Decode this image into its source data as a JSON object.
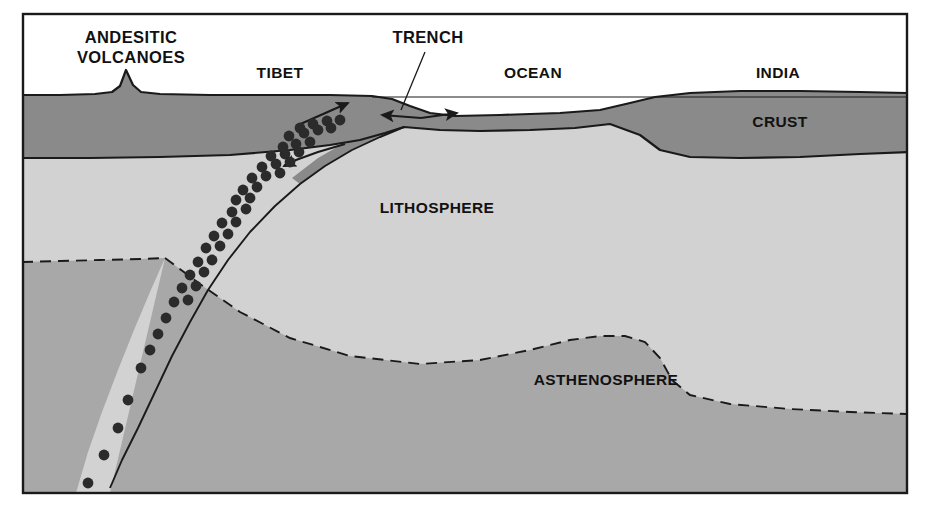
{
  "figure": {
    "type": "geological-cross-section",
    "frame": {
      "border_color": "#1a1a1a",
      "border_width": 2,
      "x": 22,
      "y": 13,
      "width": 886,
      "height": 481,
      "background": "#ffffff"
    },
    "palette": {
      "sky": "#ffffff",
      "crust": "#8a8a8a",
      "lithosphere": "#d2d2d2",
      "asthenosphere": "#a8a8a8",
      "outline": "#1a1a1a",
      "earthquake_dot": "#2b2b2b",
      "text": "#111111"
    }
  },
  "labels": [
    {
      "id": "andesitic-volcanoes",
      "line1": "ANDESITIC",
      "line2": "VOLCANOES",
      "x": 131,
      "y1": 43,
      "y2": 63,
      "anchor": "middle",
      "size": "label-lg"
    },
    {
      "id": "tibet",
      "text": "TIBET",
      "x": 280,
      "y": 78,
      "anchor": "middle",
      "size": "label-md"
    },
    {
      "id": "trench",
      "text": "TRENCH",
      "x": 428,
      "y": 43,
      "anchor": "middle",
      "size": "label-lg"
    },
    {
      "id": "ocean",
      "text": "OCEAN",
      "x": 533,
      "y": 78,
      "anchor": "middle",
      "size": "label-md"
    },
    {
      "id": "india",
      "text": "INDIA",
      "x": 778,
      "y": 78,
      "anchor": "middle",
      "size": "label-md"
    },
    {
      "id": "crust",
      "text": "CRUST",
      "x": 780,
      "y": 127,
      "anchor": "middle",
      "size": "label-md"
    },
    {
      "id": "lithosphere",
      "text": "LITHOSPHERE",
      "x": 437,
      "y": 213,
      "anchor": "middle",
      "size": "label-md"
    },
    {
      "id": "asthenosphere",
      "text": "ASTHENOSPHERE",
      "x": 606,
      "y": 385,
      "anchor": "middle",
      "size": "label-md"
    }
  ],
  "geometry": {
    "crust_top_surface": "M 22 95 L 60 95 L 95 94 L 112 92 L 120 86 L 126 70 L 133 85 L 141 92 L 160 94 L 210 95 L 270 95 L 330 95 L 372 96 L 392 99 L 410 106 L 430 113 L 455 116 L 500 115 L 560 113 L 600 110 L 630 103 L 655 97 L 690 93 L 740 91 L 800 91 L 860 92 L 908 93",
    "crust_bottom_left": "M 22 158 L 90 158 L 160 157 L 230 155 L 290 150 L 330 145 L 360 140 L 385 133 L 404 127",
    "sea_level_line": {
      "x1": 372,
      "y1": 97,
      "x2": 908,
      "y2": 97
    },
    "ocean_crust_bottom": "M 404 127 L 440 130 L 480 131 L 530 130 L 575 128 L 610 124 L 640 135 L 660 150 L 690 157 L 740 158 L 800 157 L 860 154 L 908 152",
    "slab_line": "M 404 127 L 380 137 L 352 150 L 325 166 L 300 184 L 275 206 L 250 232 L 228 260 L 208 290 L 190 322 L 172 356 L 155 392 L 138 428 L 122 460 L 110 486",
    "asthenosphere_left_dash": "M 22 262 L 60 261 L 100 260 L 140 259 L 165 258",
    "asthenosphere_right_dash": "M 165 258 L 200 284 L 240 312 L 290 338 L 350 356 L 420 364 L 480 360 L 530 350 L 570 340 L 600 336 L 625 336 L 645 342 L 660 358 L 672 380 L 690 395 L 730 404 L 790 409 L 850 412 L 908 414",
    "asthenosphere_fill_left": "M 22 262 L 60 261 L 100 260 L 140 259 L 165 258 L 148 300 L 130 345 L 112 390 L 96 435 L 82 480 L 22 480 Z",
    "asthenosphere_fill_right": "M 165 258 L 200 284 L 240 312 L 290 338 L 350 356 L 420 364 L 480 360 L 530 350 L 570 340 L 600 336 L 625 336 L 645 342 L 660 358 L 672 380 L 690 395 L 730 404 L 790 409 L 850 412 L 908 414 L 908 493 L 110 493 Z"
  },
  "arrows": [
    {
      "id": "tibet-uplift-arrow",
      "direction": "up-right",
      "x1": 296,
      "y1": 124,
      "x2": 348,
      "y2": 103
    },
    {
      "id": "trench-convergence-arrow-left",
      "direction": "left",
      "x1": 420,
      "y1": 118,
      "x2": 383,
      "y2": 115
    },
    {
      "id": "trench-convergence-arrow-right",
      "direction": "right",
      "x1": 420,
      "y1": 118,
      "x2": 455,
      "y2": 113
    },
    {
      "id": "slab-descent-arrow",
      "direction": "down-left",
      "x1": 345,
      "y1": 144,
      "x2": 282,
      "y2": 166
    }
  ],
  "trench_leader_line": {
    "x1": 425,
    "y1": 52,
    "x2": 401,
    "y2": 110
  },
  "earthquake_foci": {
    "name": "earthquake-hypocenters",
    "radius": 5.4,
    "count": 46,
    "points": [
      [
        300,
        128
      ],
      [
        313,
        124
      ],
      [
        327,
        121
      ],
      [
        340,
        120
      ],
      [
        289,
        136
      ],
      [
        304,
        133
      ],
      [
        318,
        130
      ],
      [
        331,
        128
      ],
      [
        283,
        147
      ],
      [
        296,
        144
      ],
      [
        310,
        142
      ],
      [
        271,
        156
      ],
      [
        285,
        154
      ],
      [
        299,
        152
      ],
      [
        262,
        167
      ],
      [
        276,
        164
      ],
      [
        290,
        162
      ],
      [
        252,
        178
      ],
      [
        266,
        176
      ],
      [
        280,
        173
      ],
      [
        243,
        190
      ],
      [
        257,
        187
      ],
      [
        236,
        200
      ],
      [
        250,
        198
      ],
      [
        232,
        212
      ],
      [
        246,
        209
      ],
      [
        222,
        223
      ],
      [
        236,
        222
      ],
      [
        214,
        236
      ],
      [
        228,
        234
      ],
      [
        206,
        248
      ],
      [
        220,
        246
      ],
      [
        198,
        262
      ],
      [
        212,
        260
      ],
      [
        190,
        275
      ],
      [
        204,
        272
      ],
      [
        182,
        288
      ],
      [
        196,
        286
      ],
      [
        174,
        302
      ],
      [
        188,
        300
      ],
      [
        166,
        318
      ],
      [
        158,
        334
      ],
      [
        150,
        350
      ],
      [
        141,
        368
      ],
      [
        128,
        400
      ],
      [
        118,
        428
      ],
      [
        104,
        455
      ],
      [
        88,
        483
      ]
    ]
  }
}
